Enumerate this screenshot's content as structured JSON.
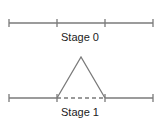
{
  "stages": [
    {
      "label": "Stage 0",
      "description": "line segment divided into three equal parts"
    },
    {
      "label": "Stage 1",
      "description": "middle third replaced by two sides of an equilateral triangle; removed middle shown dashed"
    }
  ],
  "colors": {
    "line": "#7a7a7a",
    "text": "#222222"
  }
}
